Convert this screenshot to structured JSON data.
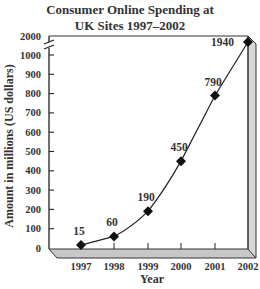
{
  "chart_data": {
    "type": "line",
    "title": "Consumer Online Spending at UK Sites 1997–2002",
    "title_lines": [
      "Consumer Online Spending at",
      "UK Sites 1997–2002"
    ],
    "xlabel": "Year",
    "ylabel": "Amount in millions (US dollars)",
    "categories": [
      "1997",
      "1998",
      "1999",
      "2000",
      "2001",
      "2002"
    ],
    "x": [
      1997,
      1998,
      1999,
      2000,
      2001,
      2002
    ],
    "values": [
      15,
      60,
      190,
      450,
      790,
      1940
    ],
    "data_labels": [
      "15",
      "60",
      "190",
      "450",
      "790",
      "1940"
    ],
    "y_ticks": [
      "0",
      "100",
      "200",
      "300",
      "400",
      "500",
      "600",
      "700",
      "800",
      "900",
      "1000",
      "2000"
    ],
    "ylim": [
      0,
      2000
    ],
    "y_axis_break": "between 1000 and 2000",
    "grid": false,
    "legend": null,
    "marker": "diamond",
    "frame": "3D shaded border"
  }
}
